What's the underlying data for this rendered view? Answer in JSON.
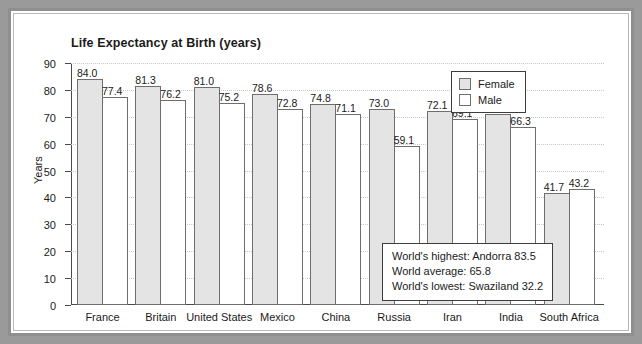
{
  "chart_data": {
    "type": "bar",
    "title": "Life Expectancy at Birth (years)",
    "xlabel": "",
    "ylabel": "Years",
    "ylim": [
      0,
      90
    ],
    "yticks": [
      0,
      10,
      20,
      30,
      40,
      50,
      60,
      70,
      80,
      90
    ],
    "grid": true,
    "legend_position": "top-right",
    "categories": [
      "France",
      "Britain",
      "United States",
      "Mexico",
      "China",
      "Russia",
      "Iran",
      "India",
      "South Africa"
    ],
    "series": [
      {
        "name": "Female",
        "color": "#e4e4e4",
        "values": [
          84.0,
          81.3,
          81.0,
          78.6,
          74.8,
          73.0,
          72.1,
          71.2,
          41.7
        ],
        "labels": [
          "84.0",
          "81.3",
          "81.0",
          "78.6",
          "74.8",
          "73.0",
          "72.1",
          "71.2",
          "41.7"
        ]
      },
      {
        "name": "Male",
        "color": "#ffffff",
        "values": [
          77.4,
          76.2,
          75.2,
          72.8,
          71.1,
          59.1,
          69.1,
          66.3,
          43.2
        ],
        "labels": [
          "77.4",
          "76.2",
          "75.2",
          "72.8",
          "71.1",
          "59.1",
          "69.1",
          "66.3",
          "43.2"
        ]
      }
    ],
    "annotations": [
      "World's highest: Andorra 83.5",
      "World average: 65.8",
      "World's lowest: Swaziland 32.2"
    ]
  }
}
